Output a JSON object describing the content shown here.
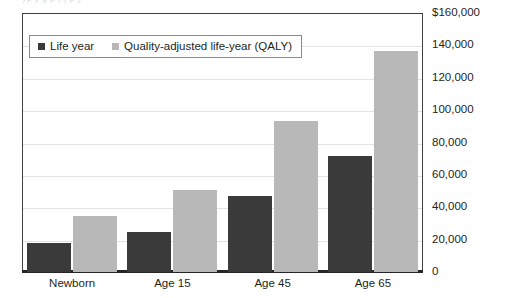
{
  "figure": {
    "clipped_top_text": "yp y g p ( ) p y",
    "background_color": "#ffffff",
    "frame_color": "#3f3f3f",
    "gridline_color": "#e3e3e3",
    "baseline_color": "#262626"
  },
  "legend": {
    "position": "inside-top-left",
    "entries": [
      {
        "label": "Life year",
        "color": "#3a3a3a",
        "key": "life_year"
      },
      {
        "label": "Quality-adjusted life-year (QALY)",
        "color": "#b8b8b8",
        "key": "qaly"
      }
    ]
  },
  "chart_data": {
    "type": "bar",
    "title": "",
    "xlabel": "",
    "ylabel": "",
    "categories": [
      "Newborn",
      "Age 15",
      "Age 45",
      "Age 65"
    ],
    "series": [
      {
        "name": "Life year",
        "color": "#3a3a3a",
        "values": [
          18000,
          24700,
          47000,
          71600
        ]
      },
      {
        "name": "Quality-adjusted life-year (QALY)",
        "color": "#b8b8b8",
        "values": [
          34600,
          50600,
          93300,
          136500
        ]
      }
    ],
    "ylim": [
      0,
      160000
    ],
    "ytick_values": [
      160000,
      140000,
      120000,
      100000,
      80000,
      60000,
      40000,
      20000,
      0
    ],
    "ytick_labels": [
      "$160,000",
      "140,000",
      "120,000",
      "100,000",
      "80,000",
      "60,000",
      "40,000",
      "20,000",
      "0"
    ],
    "ytick_position": "right",
    "grid": true,
    "grid_axis": "y",
    "legend_position": "upper left (inside plot)"
  }
}
